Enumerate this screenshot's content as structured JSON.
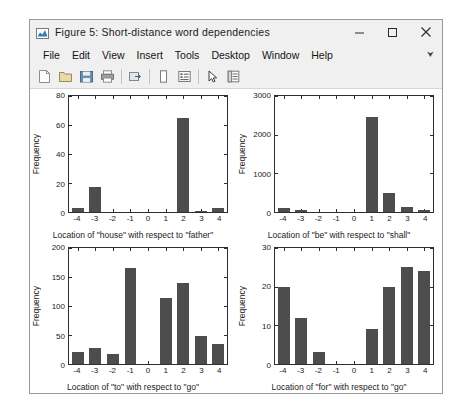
{
  "window": {
    "title": "Figure 5: Short-distance word dependencies",
    "title_icon": "figure-chart-icon",
    "controls": {
      "minimize": "minimize-icon",
      "maximize": "maximize-icon",
      "close": "close-icon"
    }
  },
  "menubar": {
    "items": [
      {
        "label": "File"
      },
      {
        "label": "Edit"
      },
      {
        "label": "View"
      },
      {
        "label": "Insert"
      },
      {
        "label": "Tools"
      },
      {
        "label": "Desktop"
      },
      {
        "label": "Window"
      },
      {
        "label": "Help"
      }
    ],
    "overflow": "⮟"
  },
  "toolbar": {
    "buttons": [
      {
        "name": "new-figure-icon"
      },
      {
        "name": "open-file-icon"
      },
      {
        "name": "save-figure-icon"
      },
      {
        "name": "print-figure-icon"
      },
      {
        "name": "separator"
      },
      {
        "name": "link-plot-icon"
      },
      {
        "name": "separator"
      },
      {
        "name": "insert-colorbar-icon"
      },
      {
        "name": "insert-legend-icon"
      },
      {
        "name": "separator"
      },
      {
        "name": "edit-pointer-icon"
      },
      {
        "name": "show-plot-tools-icon"
      }
    ]
  },
  "chart_data": [
    {
      "type": "bar",
      "id": "subplot-house-father",
      "title": "",
      "xlabel": "Location of \"house\" with respect to \"father\"",
      "ylabel": "Frequency",
      "categories": [
        "-4",
        "-3",
        "-2",
        "-1",
        "0",
        "1",
        "2",
        "3",
        "4"
      ],
      "values": [
        3,
        17,
        0,
        0,
        0,
        0,
        65,
        1,
        3
      ],
      "ylim": [
        0,
        80
      ],
      "yticks": [
        0,
        20,
        40,
        60,
        80
      ],
      "grid": false,
      "legend": "none",
      "bar_color": "#4d4d4d"
    },
    {
      "type": "bar",
      "id": "subplot-be-shall",
      "title": "",
      "xlabel": "Location of \"be\" with respect to \"shall\"",
      "ylabel": "Frequency",
      "categories": [
        "-4",
        "-3",
        "-2",
        "-1",
        "0",
        "1",
        "2",
        "3",
        "4"
      ],
      "values": [
        110,
        60,
        0,
        0,
        0,
        2450,
        480,
        130,
        60
      ],
      "ylim": [
        0,
        3000
      ],
      "yticks": [
        0,
        1000,
        2000,
        3000
      ],
      "grid": false,
      "legend": "none",
      "bar_color": "#4d4d4d"
    },
    {
      "type": "bar",
      "id": "subplot-to-go",
      "title": "",
      "xlabel": "Location of \"to\" with respect to \"go\"",
      "ylabel": "Frequency",
      "categories": [
        "-4",
        "-3",
        "-2",
        "-1",
        "0",
        "1",
        "2",
        "3",
        "4"
      ],
      "values": [
        20,
        28,
        18,
        165,
        0,
        113,
        140,
        48,
        35
      ],
      "ylim": [
        0,
        200
      ],
      "yticks": [
        0,
        50,
        100,
        150,
        200
      ],
      "grid": false,
      "legend": "none",
      "bar_color": "#4d4d4d"
    },
    {
      "type": "bar",
      "id": "subplot-for-go",
      "title": "",
      "xlabel": "Location of \"for\" with respect to \"go\"",
      "ylabel": "Frequency",
      "categories": [
        "-4",
        "-3",
        "-2",
        "-1",
        "0",
        "1",
        "2",
        "3",
        "4"
      ],
      "values": [
        20,
        12,
        3,
        0,
        0,
        9,
        20,
        25,
        24
      ],
      "ylim": [
        0,
        30
      ],
      "yticks": [
        0,
        10,
        20,
        30
      ],
      "grid": false,
      "legend": "none",
      "bar_color": "#4d4d4d"
    }
  ],
  "colors": {
    "window_chrome": "#f0f0f0",
    "window_border": "#9a9a9a",
    "figure_background": "#ffffff",
    "axis_line": "#2e2e2e",
    "bar_fill": "#4d4d4d",
    "text": "#1a1a1a"
  }
}
